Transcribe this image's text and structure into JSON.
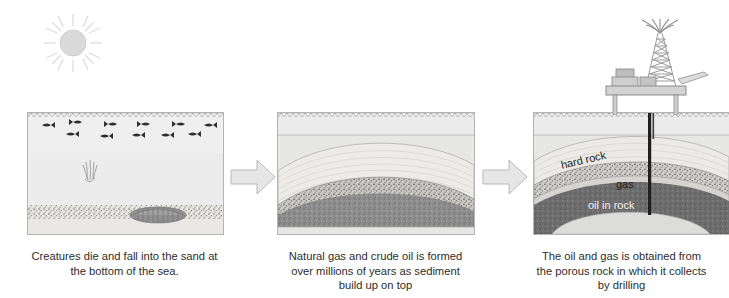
{
  "diagram": {
    "background_color": "#ffffff"
  },
  "sun": {
    "name": "sun",
    "color": "#d8d8d8",
    "ray_count": 12
  },
  "panels": [
    {
      "id": "panel-1",
      "step_number": 1,
      "scene": "sea with fish, sinking creature and sandy sea bed",
      "caption_lines": [
        "Creatures die and fall into the sand at",
        "the bottom of the sea."
      ],
      "layers": [
        {
          "name": "sea water",
          "color": "#ececec"
        },
        {
          "name": "sand",
          "color": "#e8e8e6"
        }
      ],
      "fish_count": 11,
      "has_dead_creature": true,
      "has_sinking_creature": true
    },
    {
      "id": "panel-2",
      "step_number": 2,
      "scene": "sediment layers arched into a dome over millions of years",
      "caption_lines": [
        "Natural gas and crude oil is formed",
        "over millions of years as sediment",
        "build up on top"
      ],
      "layers": [
        {
          "name": "sea water",
          "color": "#ebebeb"
        },
        {
          "name": "sediment",
          "color": "#eceae6"
        },
        {
          "name": "porous rock",
          "color": "#c9c9c7"
        },
        {
          "name": "dark rock",
          "color": "#8e8e8e"
        },
        {
          "name": "base rock",
          "color": "#e4e4e2"
        }
      ]
    },
    {
      "id": "panel-3",
      "step_number": 3,
      "scene": "offshore rig drilling into the reservoir",
      "caption_lines": [
        "The oil and gas is obtained from",
        "the porous rock in which it collects",
        "by drilling"
      ],
      "geology_labels": [
        {
          "key": "hard-rock",
          "text": "hard rock"
        },
        {
          "key": "gas",
          "text": "gas"
        },
        {
          "key": "oil-in-rock",
          "text": "oil in rock"
        }
      ],
      "layers": [
        {
          "name": "sea water",
          "color": "#ebebeb"
        },
        {
          "name": "hard rock",
          "color": "#ddddd9"
        },
        {
          "name": "gas",
          "color": "#cfcfcc"
        },
        {
          "name": "oil in rock",
          "color": "#6e6e6e"
        },
        {
          "name": "base rock",
          "color": "#dcdcda"
        }
      ],
      "rig": {
        "name": "offshore-oil-rig",
        "parts": [
          "derrick tower",
          "platform deck",
          "cabin",
          "helipad",
          "legs",
          "drill pipe"
        ],
        "color": "#c6c6c6"
      }
    }
  ],
  "arrows": [
    {
      "id": "arrow-1",
      "direction": "right",
      "color": "#e3e3e3"
    },
    {
      "id": "arrow-2",
      "direction": "right",
      "color": "#e3e3e3"
    }
  ]
}
